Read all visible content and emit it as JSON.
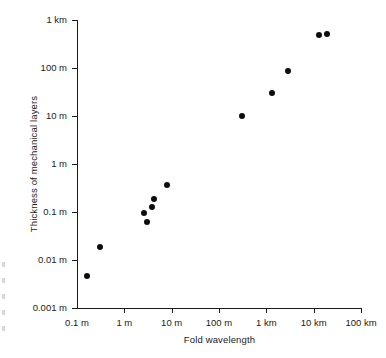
{
  "chart_data": {
    "type": "scatter",
    "title": "",
    "xlabel": "Fold wavelength",
    "ylabel": "Thickness of mechanical layers",
    "xscale": "log",
    "yscale": "log",
    "grid": false,
    "legend": "none",
    "xlim": [
      0.1,
      100000
    ],
    "ylim": [
      0.001,
      1000
    ],
    "x_unit": "m",
    "y_unit": "m",
    "xticks": [
      {
        "value": 0.1,
        "label": "0.1 m"
      },
      {
        "value": 1,
        "label": "1 m"
      },
      {
        "value": 10,
        "label": "10 m"
      },
      {
        "value": 100,
        "label": "100 m"
      },
      {
        "value": 1000,
        "label": "1 km"
      },
      {
        "value": 10000,
        "label": "10 km"
      },
      {
        "value": 100000,
        "label": "100 km"
      }
    ],
    "yticks": [
      {
        "value": 1000,
        "label": "1 km"
      },
      {
        "value": 100,
        "label": "100 m"
      },
      {
        "value": 10,
        "label": "10 m"
      },
      {
        "value": 1,
        "label": "1 m"
      },
      {
        "value": 0.1,
        "label": "0.1 m"
      },
      {
        "value": 0.01,
        "label": "0.01 m"
      },
      {
        "value": 0.001,
        "label": "0.001 m"
      }
    ],
    "marker": {
      "shape": "circle",
      "color": "#0d0d0d",
      "size_px": 6
    },
    "points": [
      {
        "x": 0.16,
        "y": 0.0047
      },
      {
        "x": 0.31,
        "y": 0.019
      },
      {
        "x": 2.6,
        "y": 0.094
      },
      {
        "x": 3.0,
        "y": 0.062
      },
      {
        "x": 3.9,
        "y": 0.13
      },
      {
        "x": 4.3,
        "y": 0.19
      },
      {
        "x": 8.0,
        "y": 0.37
      },
      {
        "x": 310,
        "y": 9.8
      },
      {
        "x": 1300,
        "y": 30
      },
      {
        "x": 2900,
        "y": 88
      },
      {
        "x": 13000,
        "y": 490
      },
      {
        "x": 19000,
        "y": 520
      }
    ]
  }
}
